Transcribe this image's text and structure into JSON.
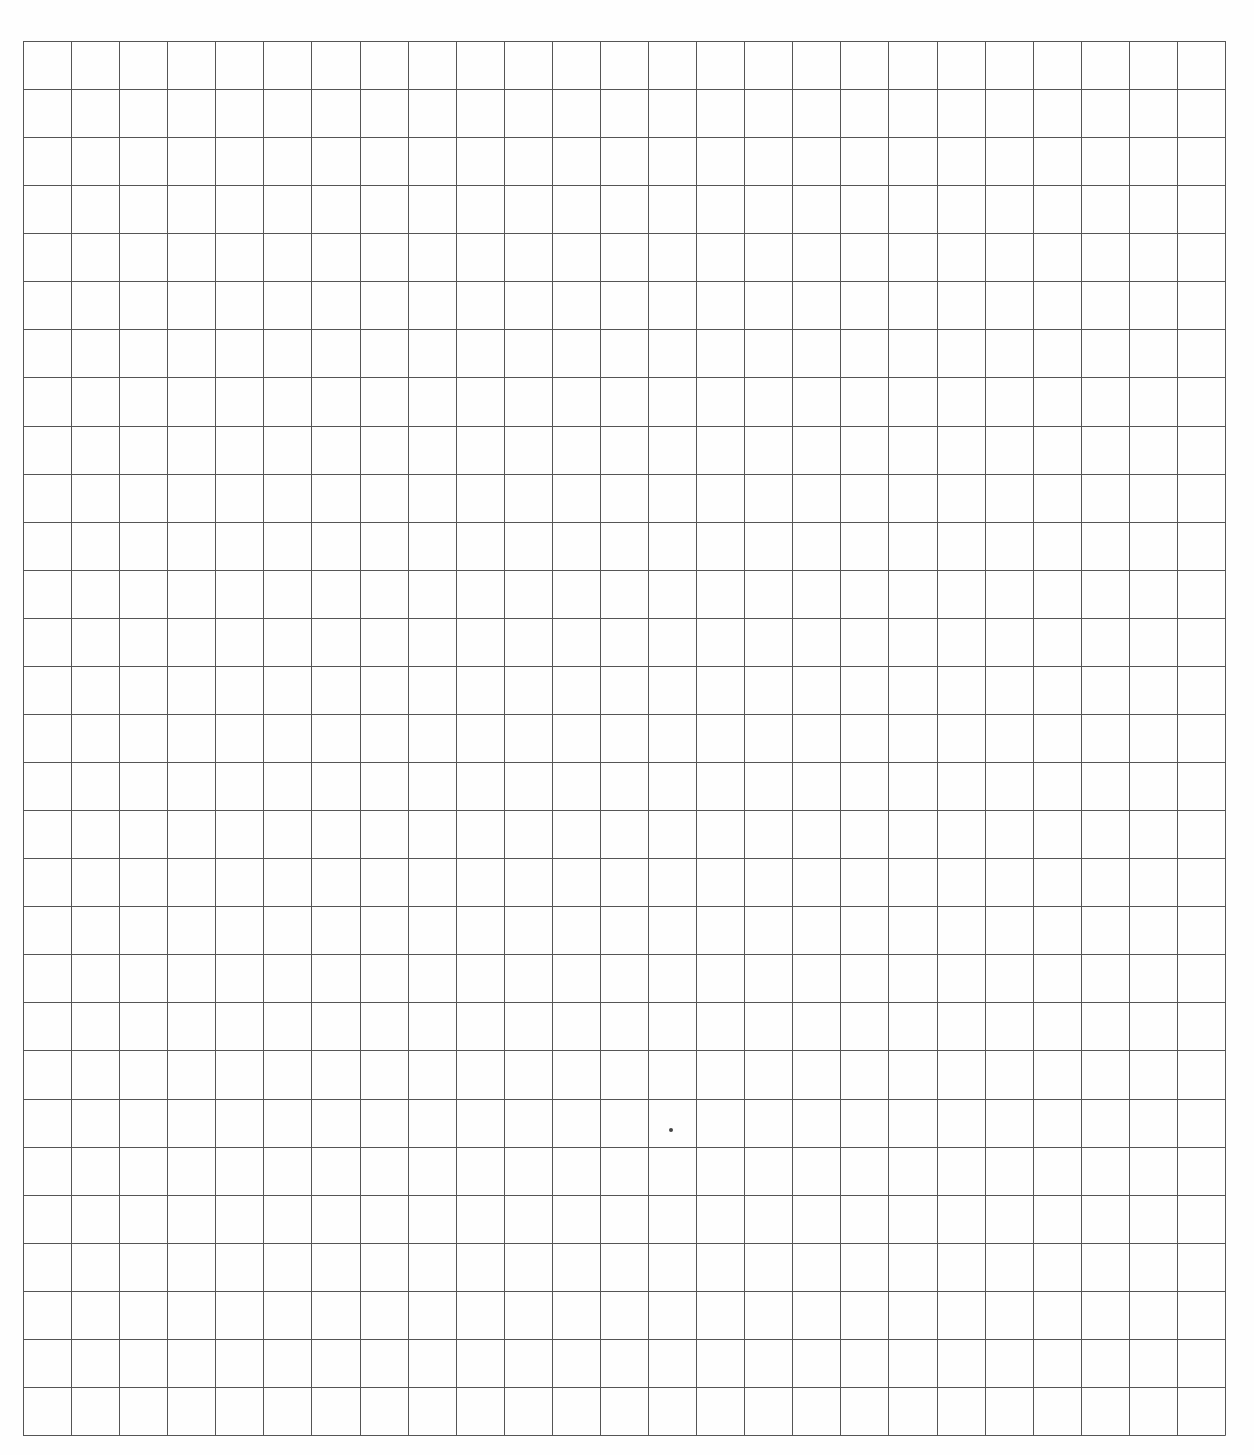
{
  "page": {
    "type": "graph-paper",
    "background_color": "#fefefe",
    "line_color": "#555555"
  },
  "grid": {
    "left": 23,
    "top": 41,
    "columns": 25,
    "rows": 29,
    "cell_size": 48.08,
    "width": 1202,
    "height": 1394
  },
  "marks": [
    {
      "name": "ink-dot",
      "x": 671,
      "y": 1130,
      "size": 4
    }
  ]
}
